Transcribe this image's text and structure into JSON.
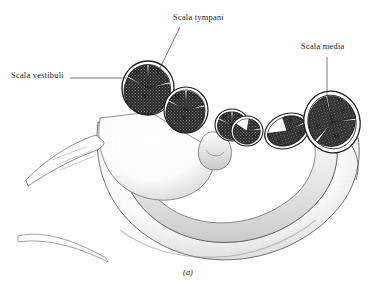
{
  "figure": {
    "caption": "(a)",
    "background_color": "#ffffff",
    "ink_color": "#1a1a1a"
  },
  "labels": [
    {
      "id": "scala-tympani",
      "text": "Scala tympani",
      "leader": "diagonal-down-left"
    },
    {
      "id": "scala-vestibuli",
      "text": "Scala vestibuli",
      "leader": "horizontal-right"
    },
    {
      "id": "scala-media",
      "text": "Scala media",
      "leader": "vertical-down"
    }
  ],
  "legend_keys": {
    "M": "scala media",
    "T": "scala tympani",
    "V": "scala vestibuli"
  },
  "cross_sections": [
    {
      "id": "turn-1",
      "letters": [
        "M",
        "T",
        "V"
      ]
    },
    {
      "id": "turn-2",
      "letters": [
        "M",
        "T",
        "V"
      ]
    },
    {
      "id": "turn-3",
      "letters": [
        "M",
        "T",
        "V"
      ]
    },
    {
      "id": "turn-4",
      "letters": [
        "T",
        "V",
        "M"
      ]
    },
    {
      "id": "turn-5",
      "letters": [
        "T",
        "V",
        "M"
      ]
    },
    {
      "id": "turn-6",
      "letters": [
        "T",
        "V",
        "M"
      ]
    }
  ]
}
